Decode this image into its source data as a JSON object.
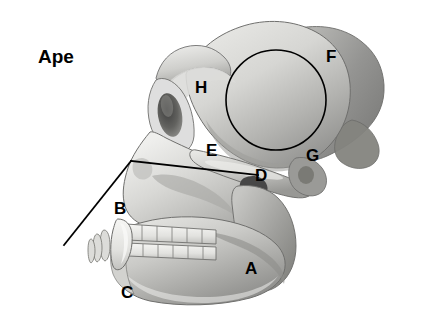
{
  "figure": {
    "title": "Ape",
    "title_position": {
      "x": 38,
      "y": 47
    },
    "background_color": "#ffffff",
    "ink_color": "#000000",
    "canvas": {
      "width": 440,
      "height": 324
    },
    "labels": [
      {
        "key": "A",
        "text": "A",
        "x": 245,
        "y": 260,
        "region": "mandible-body"
      },
      {
        "key": "B",
        "text": "B",
        "x": 114,
        "y": 200,
        "region": "canine-incisor-region"
      },
      {
        "key": "C",
        "text": "C",
        "x": 121,
        "y": 284,
        "region": "mandible-inferior-border"
      },
      {
        "key": "D",
        "text": "D",
        "x": 255,
        "y": 167,
        "region": "zygomatic-arch"
      },
      {
        "key": "E",
        "text": "E",
        "x": 206,
        "y": 142,
        "region": "temporal-fossa"
      },
      {
        "key": "F",
        "text": "F",
        "x": 326,
        "y": 48,
        "region": "parietal-occipital"
      },
      {
        "key": "G",
        "text": "G",
        "x": 306,
        "y": 147,
        "region": "external-auditory-meatus"
      },
      {
        "key": "H",
        "text": "H",
        "x": 195,
        "y": 79,
        "region": "supraorbital-torus"
      }
    ],
    "annotations": {
      "braincase_circle": {
        "cx": 276,
        "cy": 100,
        "r": 50,
        "stroke": "#000000",
        "stroke_width": 1.6
      },
      "facial_angle": {
        "vertex": {
          "x": 131,
          "y": 161
        },
        "upper_arm_end": {
          "x": 258,
          "y": 175
        },
        "lower_arm_end": {
          "x": 64,
          "y": 245
        },
        "stroke": "#000000",
        "stroke_width": 1.8
      }
    },
    "palette": {
      "bone_light": "#ededea",
      "bone_mid": "#c9c9c6",
      "bone_shade": "#a8a8a5",
      "bone_dark": "#8e8e8c",
      "bone_deep": "#6f6f6e",
      "socket_dark": "#4a4a4a",
      "outline": "#5c5c5a"
    }
  }
}
